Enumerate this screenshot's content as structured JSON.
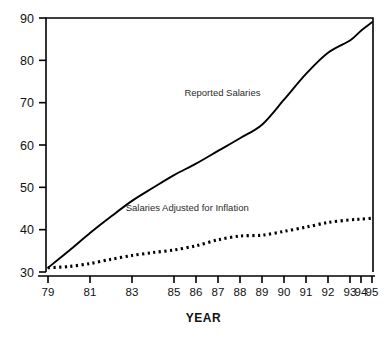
{
  "chart_data": {
    "type": "line",
    "title": "",
    "subtitle": "",
    "xlabel": "YEAR",
    "ylabel": "",
    "grid": false,
    "legend_position": "inline-annotation",
    "xlim": [
      79,
      95
    ],
    "ylim": [
      30,
      90
    ],
    "y_ticks": [
      30,
      40,
      50,
      60,
      70,
      80,
      90
    ],
    "x_ticks": [
      79,
      81,
      83,
      85,
      86,
      87,
      88,
      89,
      90,
      91,
      92,
      93,
      94,
      95
    ],
    "x_tick_labels": [
      "79",
      "81",
      "83",
      "85",
      "86",
      "87",
      "88",
      "89",
      "90",
      "91",
      "92",
      "93",
      "94",
      "95"
    ],
    "y_tick_labels": [
      "30",
      "40",
      "50",
      "60",
      "70",
      "80",
      "90"
    ],
    "x": [
      79,
      80,
      81,
      82,
      83,
      84,
      85,
      86,
      87,
      88,
      89,
      90,
      91,
      92,
      93,
      94,
      95
    ],
    "series": [
      {
        "name": "Reported Salaries",
        "style": "solid",
        "color": "#000000",
        "label_x": 87.2,
        "label_y": 71.5,
        "values": [
          31.0,
          35.0,
          39.2,
          43.1,
          46.8,
          49.9,
          52.9,
          55.6,
          58.6,
          61.6,
          64.8,
          70.7,
          76.8,
          81.8,
          84.7,
          87.0,
          89.0
        ]
      },
      {
        "name": "Salaries Adjusted for Inflation",
        "style": "dotted",
        "color": "#000000",
        "label_x": 85.6,
        "label_y": 44.3,
        "values": [
          31.0,
          31.3,
          32.0,
          33.0,
          33.9,
          34.6,
          35.2,
          36.2,
          37.6,
          38.5,
          38.7,
          39.6,
          40.6,
          41.7,
          42.3,
          42.5,
          42.7
        ]
      }
    ]
  },
  "axis": {
    "x_title": "YEAR"
  }
}
